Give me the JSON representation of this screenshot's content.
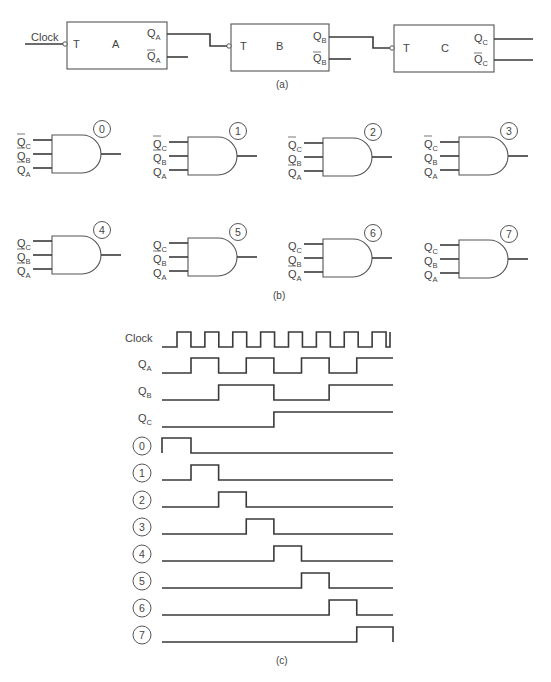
{
  "part_a": {
    "caption": "(a)",
    "clock_label": "Clock",
    "flip_flops": [
      {
        "name": "A",
        "input": "T",
        "q": "Q",
        "q_sub": "A",
        "qbar": "Q",
        "qbar_sub": "A"
      },
      {
        "name": "B",
        "input": "T",
        "q": "Q",
        "q_sub": "B",
        "qbar": "Q",
        "qbar_sub": "B"
      },
      {
        "name": "C",
        "input": "T",
        "q": "Q",
        "q_sub": "C",
        "qbar": "Q",
        "qbar_sub": "C"
      }
    ]
  },
  "part_b": {
    "caption": "(b)",
    "gates": [
      {
        "id": "0",
        "inputs": [
          {
            "sig": "C",
            "inv": true
          },
          {
            "sig": "B",
            "inv": true
          },
          {
            "sig": "A",
            "inv": true
          }
        ]
      },
      {
        "id": "1",
        "inputs": [
          {
            "sig": "C",
            "inv": true
          },
          {
            "sig": "B",
            "inv": true
          },
          {
            "sig": "A",
            "inv": false
          }
        ]
      },
      {
        "id": "2",
        "inputs": [
          {
            "sig": "C",
            "inv": true
          },
          {
            "sig": "B",
            "inv": false
          },
          {
            "sig": "A",
            "inv": true
          }
        ]
      },
      {
        "id": "3",
        "inputs": [
          {
            "sig": "C",
            "inv": true
          },
          {
            "sig": "B",
            "inv": false
          },
          {
            "sig": "A",
            "inv": false
          }
        ]
      },
      {
        "id": "4",
        "inputs": [
          {
            "sig": "C",
            "inv": false
          },
          {
            "sig": "B",
            "inv": true
          },
          {
            "sig": "A",
            "inv": true
          }
        ]
      },
      {
        "id": "5",
        "inputs": [
          {
            "sig": "C",
            "inv": false
          },
          {
            "sig": "B",
            "inv": true
          },
          {
            "sig": "A",
            "inv": false
          }
        ]
      },
      {
        "id": "6",
        "inputs": [
          {
            "sig": "C",
            "inv": false
          },
          {
            "sig": "B",
            "inv": false
          },
          {
            "sig": "A",
            "inv": true
          }
        ]
      },
      {
        "id": "7",
        "inputs": [
          {
            "sig": "C",
            "inv": false
          },
          {
            "sig": "B",
            "inv": false
          },
          {
            "sig": "A",
            "inv": false
          }
        ]
      }
    ]
  },
  "part_c": {
    "caption": "(c)",
    "signals": [
      {
        "label": "Clock",
        "sub": "",
        "circled": false,
        "wave": "clock"
      },
      {
        "label": "Q",
        "sub": "A",
        "circled": false,
        "wave": [
          0,
          1,
          0,
          1,
          0,
          1,
          0,
          1
        ]
      },
      {
        "label": "Q",
        "sub": "B",
        "circled": false,
        "wave": [
          0,
          0,
          1,
          1,
          0,
          0,
          1,
          1
        ]
      },
      {
        "label": "Q",
        "sub": "C",
        "circled": false,
        "wave": [
          0,
          0,
          0,
          0,
          1,
          1,
          1,
          1
        ]
      },
      {
        "label": "0",
        "sub": "",
        "circled": true,
        "wave": [
          1,
          0,
          0,
          0,
          0,
          0,
          0,
          0
        ]
      },
      {
        "label": "1",
        "sub": "",
        "circled": true,
        "wave": [
          0,
          1,
          0,
          0,
          0,
          0,
          0,
          0
        ]
      },
      {
        "label": "2",
        "sub": "",
        "circled": true,
        "wave": [
          0,
          0,
          1,
          0,
          0,
          0,
          0,
          0
        ]
      },
      {
        "label": "3",
        "sub": "",
        "circled": true,
        "wave": [
          0,
          0,
          0,
          1,
          0,
          0,
          0,
          0
        ]
      },
      {
        "label": "4",
        "sub": "",
        "circled": true,
        "wave": [
          0,
          0,
          0,
          0,
          1,
          0,
          0,
          0
        ]
      },
      {
        "label": "5",
        "sub": "",
        "circled": true,
        "wave": [
          0,
          0,
          0,
          0,
          0,
          1,
          0,
          0
        ]
      },
      {
        "label": "6",
        "sub": "",
        "circled": true,
        "wave": [
          0,
          0,
          0,
          0,
          0,
          0,
          1,
          0
        ]
      },
      {
        "label": "7",
        "sub": "",
        "circled": true,
        "wave": [
          0,
          0,
          0,
          0,
          0,
          0,
          0,
          1
        ]
      }
    ]
  }
}
